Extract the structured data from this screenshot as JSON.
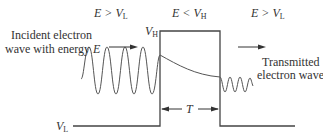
{
  "diagram": {
    "regions": [
      {
        "id": "left",
        "condition": "E > V",
        "condition_sub": "L"
      },
      {
        "id": "barrier",
        "condition": "E < V",
        "condition_sub": "H"
      },
      {
        "id": "right",
        "condition": "E > V",
        "condition_sub": "L"
      }
    ],
    "labels": {
      "incident_line1": "Incident electron",
      "incident_line2": "wave with energy ",
      "incident_energy": "E",
      "transmitted_line1": "Transmitted",
      "transmitted_line2": "electron wave",
      "vh": "V",
      "vh_sub": "H",
      "vl": "V",
      "vl_sub": "L",
      "width": "T"
    },
    "colors": {
      "line": "#444444",
      "text": "#333333",
      "background": "#ffffff"
    }
  }
}
